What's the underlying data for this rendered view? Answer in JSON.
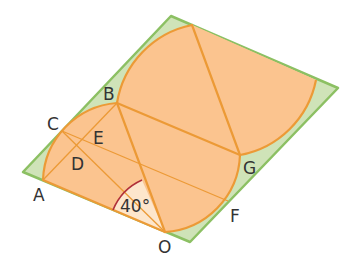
{
  "diagram": {
    "type": "geometry",
    "colors": {
      "parallelogram_fill": "#cfe3b8",
      "parallelogram_stroke": "#8cc063",
      "region_fill": "#fbc48f",
      "line_stroke": "#ec9a36",
      "angle_arc": "#b0303a",
      "angle_sector_fill": "#fde6cc",
      "label_color": "#333333"
    },
    "points": {
      "A": "A",
      "B": "B",
      "C": "C",
      "D": "D",
      "E": "E",
      "F": "F",
      "G": "G",
      "O": "O"
    },
    "angle": {
      "vertex": "O",
      "label": "40°"
    },
    "segments": [
      "AO",
      "OB",
      "BG",
      "OF",
      "CF",
      "AB",
      "CO",
      "G-top"
    ]
  }
}
